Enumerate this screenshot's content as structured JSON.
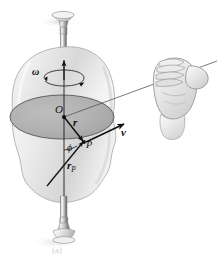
{
  "figure": {
    "kind": "physics-diagram",
    "caption": "(a)",
    "background_color": "#ffffff"
  },
  "labels": {
    "origin": "O",
    "position_vector": "r",
    "point": "P",
    "velocity_vector": "v",
    "angular_velocity": "ω",
    "angle": "ϕ",
    "point_position_vector_base": "r",
    "point_position_vector_sub": "P"
  },
  "colors": {
    "body_fill_light": "#f2f2f2",
    "body_fill_mid": "#dcdcdc",
    "body_fill_dark": "#c2c2c2",
    "body_outline": "#9a9a9a",
    "disk_fill": "#b0b0b0",
    "disk_outline": "#5a5a5a",
    "spindle_light": "#e8e8e8",
    "spindle_mid": "#a8a8a8",
    "spindle_dark": "#6e6e6e",
    "vector_stroke": "#111111",
    "thin_line": "#555555",
    "hand_fill": "#e4e4e4",
    "hand_outline": "#8a8a8a",
    "shadow": "#e0e0e0",
    "caption_text": "#cfcfcf"
  },
  "geometry": {
    "axis_x": 64,
    "axis_top_y": 18,
    "axis_bottom_y": 242,
    "axis_arrow_tip_y": 61,
    "origin_point": [
      64,
      117
    ],
    "point_P": [
      84,
      143
    ],
    "disk_center": [
      62,
      117
    ],
    "disk_rx": 52,
    "disk_ry": 22,
    "v_arrow_tip": [
      124,
      124
    ],
    "rp_tail": [
      47,
      186
    ],
    "hand_center": [
      178,
      86
    ],
    "sight_line_start": [
      64,
      117
    ],
    "sight_line_end": [
      216,
      62
    ]
  },
  "elements": {
    "rotation_axis_name": "vertical rotation axis",
    "disk_name": "rotation plane disk",
    "body_name": "rigid body blob",
    "hand_name": "right-hand-rule hand",
    "top_spindle_name": "top pivot spindle",
    "bottom_spindle_name": "bottom pivot spindle"
  }
}
